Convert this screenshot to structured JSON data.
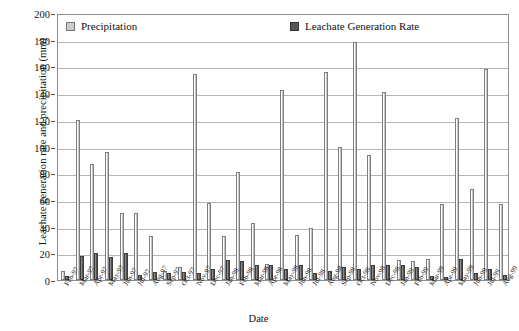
{
  "chart_data": {
    "type": "bar",
    "title": "",
    "xlabel": "Date",
    "ylabel": "Leachate generation rate and precipitation (mm)",
    "ylim": [
      0,
      200
    ],
    "ytick_step": 20,
    "yticks": [
      0,
      20,
      40,
      60,
      80,
      100,
      120,
      140,
      160,
      180,
      200
    ],
    "grid": true,
    "legend_position": "top-inside",
    "categories": [
      "Feb-97",
      "Mar-97",
      "Apr-97",
      "May-97",
      "Jun-97",
      "Jul-97",
      "Aug-97",
      "Sep-97",
      "Oct-97",
      "Nov-97",
      "Dec-97",
      "Jan-98",
      "Feb-98",
      "Mar-98",
      "Apr-98",
      "May-98",
      "Jun-98",
      "Jul-98",
      "Aug-98",
      "Sep-98",
      "Oct-98",
      "Nov-98",
      "Dec-98",
      "Jan-99",
      "Feb-99",
      "Mar-99",
      "Apr-99",
      "May-99",
      "Jun-99",
      "Jul-99",
      "Aug-99"
    ],
    "series": [
      {
        "name": "Precipitation",
        "color": "#c9c9c9",
        "values": [
          7,
          120,
          87,
          96,
          50,
          50,
          33,
          7,
          10,
          154,
          58,
          33,
          81,
          43,
          12,
          142,
          34,
          39,
          156,
          100,
          178,
          94,
          141,
          15,
          14,
          16,
          57,
          121,
          68,
          158,
          57
        ]
      },
      {
        "name": "Leachate Generation Rate",
        "color": "#585858",
        "values": [
          3,
          18,
          20,
          17,
          20,
          4,
          6,
          5,
          6,
          5,
          8,
          15,
          14,
          11,
          11,
          8,
          11,
          5,
          7,
          10,
          8,
          11,
          11,
          11,
          10,
          3,
          2,
          16,
          5,
          8,
          4
        ]
      }
    ]
  },
  "legend": {
    "precipitation_label": "Precipitation",
    "leachate_label": "Leachate Generation Rate"
  },
  "axes": {
    "y_title": "Leachate generation rate and precipitation (mm)",
    "x_title": "Date"
  }
}
